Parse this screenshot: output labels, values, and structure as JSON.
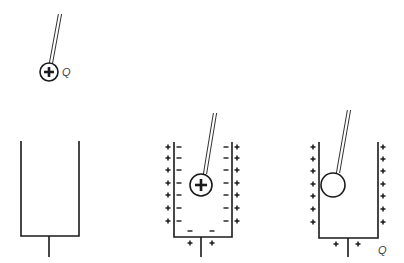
{
  "diagram": {
    "colors": {
      "ink": "#1a1a1a",
      "background": "#ffffff"
    },
    "panels": [
      {
        "id": "panel-1",
        "description": "Positively charged ball on insulating rod held above an uncharged metal cup",
        "ball": {
          "cx": 49,
          "cy": 72,
          "r": 9,
          "symbol": "+"
        },
        "rod": {
          "x1": 60,
          "y1": 14,
          "x2": 51,
          "y2": 63
        },
        "charge_label": {
          "text": "Q",
          "x": 62,
          "y": 67
        },
        "cup": {
          "left": 21,
          "right": 79,
          "top": 141,
          "bottom": 236,
          "stem_x": 49,
          "stem_bottom": 257
        }
      },
      {
        "id": "panel-2",
        "description": "Charged ball lowered inside cup; negative charge induced on inner surface, positive on outer surface",
        "ball": {
          "cx": 201,
          "cy": 185,
          "r": 11,
          "symbol": "+"
        },
        "rod": {
          "x1": 215,
          "y1": 113,
          "x2": 205,
          "y2": 174
        },
        "cup": {
          "left": 174,
          "right": 232,
          "top": 142,
          "bottom": 237,
          "stem_x": 201,
          "stem_bottom": 257
        },
        "outer_left_charges": "+",
        "inner_left_charges": "−",
        "inner_right_charges": "−",
        "outer_right_charges": "+",
        "charge_rows_y": [
          147,
          158,
          170,
          183,
          195,
          208,
          221
        ],
        "bottom_inner_charges": {
          "symbol": "−",
          "y": 231,
          "x": [
            190,
            212
          ]
        },
        "bottom_outer_charges": {
          "symbol": "+",
          "y": 243,
          "x": [
            190,
            212
          ]
        }
      },
      {
        "id": "panel-3",
        "description": "Ball touches inner wall; it becomes neutral and the cup carries charge Q on its outer surface",
        "ball": {
          "cx": 333,
          "cy": 185,
          "r": 12,
          "symbol": ""
        },
        "rod": {
          "x1": 349,
          "y1": 110,
          "x2": 338,
          "y2": 173
        },
        "charge_label": {
          "text": "Q",
          "x": 378,
          "y": 245
        },
        "cup": {
          "left": 319,
          "right": 378,
          "top": 142,
          "bottom": 238,
          "stem_x": 348,
          "stem_bottom": 257
        },
        "outer_left_charges": "+",
        "outer_right_charges": "+",
        "charge_rows_y": [
          147,
          159,
          171,
          184,
          196,
          209,
          222
        ],
        "bottom_outer_charges": {
          "symbol": "+",
          "y": 244,
          "x": [
            336,
            358
          ]
        }
      }
    ]
  }
}
